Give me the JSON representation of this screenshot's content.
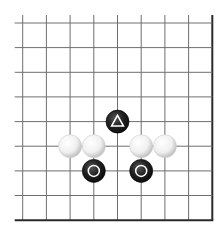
{
  "diagram": {
    "type": "go-board-fragment",
    "grid": {
      "columns": 9,
      "rows": 9,
      "x_positions": [
        22.7,
        46.4,
        70.1,
        93.8,
        117.5,
        141.2,
        164.9,
        188.6,
        212.3
      ],
      "y_positions": [
        23,
        47.6,
        72.3,
        96.9,
        121.6,
        146.2,
        170.9,
        195.5,
        220.2
      ],
      "edges": {
        "right": true,
        "bottom": true,
        "left": false,
        "top": false
      },
      "line_color": "#6e6e6e",
      "edge_color": "#2a2a2a"
    },
    "stones": [
      {
        "color": "black",
        "col": 4,
        "row": 4,
        "marker": "triangle"
      },
      {
        "color": "white",
        "col": 2,
        "row": 5,
        "marker": ""
      },
      {
        "color": "white",
        "col": 3,
        "row": 5,
        "marker": ""
      },
      {
        "color": "white",
        "col": 5,
        "row": 5,
        "marker": ""
      },
      {
        "color": "white",
        "col": 6,
        "row": 5,
        "marker": ""
      },
      {
        "color": "black",
        "col": 3,
        "row": 6,
        "marker": "circle"
      },
      {
        "color": "black",
        "col": 5,
        "row": 6,
        "marker": "circle"
      }
    ],
    "colors": {
      "black_stone": "#1c1c1c",
      "white_stone": "#f4f4f4",
      "marker_on_black": "#ffffff"
    }
  }
}
